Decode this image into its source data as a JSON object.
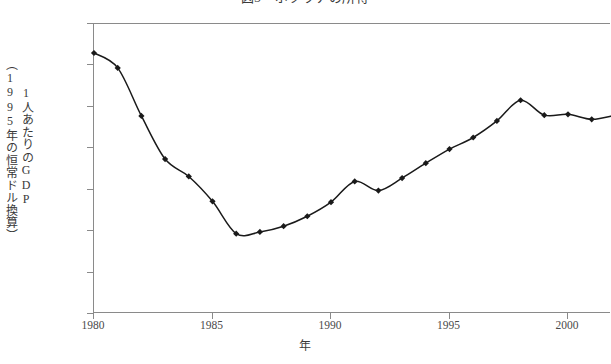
{
  "chart_data": {
    "type": "line",
    "title": "図3　ボツワナの所得",
    "xlabel": "年",
    "ylabel": "1人あたりのGDP（1995年の恒常ドル換算）",
    "ylabel_columns": [
      "（1995年の恒常ドル換算）",
      "1人あたりのGDP"
    ],
    "xlim": [
      1980,
      2002
    ],
    "ylim": [
      700,
      1050
    ],
    "yticks": [
      700,
      750,
      800,
      850,
      900,
      950,
      1000,
      1050
    ],
    "ytick_labels": [
      "700",
      "750",
      "800",
      "850",
      "900",
      "950",
      "1000",
      "1050"
    ],
    "xticks": [
      1980,
      1985,
      1990,
      1995,
      2000
    ],
    "xtick_labels": [
      "1980",
      "1985",
      "1990",
      "1995",
      "2000"
    ],
    "grid": false,
    "legend": false,
    "marker": "diamond",
    "line_color": "#1a1a1a",
    "x": [
      1980,
      1981,
      1982,
      1983,
      1984,
      1985,
      1986,
      1987,
      1988,
      1989,
      1990,
      1991,
      1992,
      1993,
      1994,
      1995,
      1996,
      1997,
      1998,
      1999,
      2000,
      2001,
      2002
    ],
    "values": [
      1015,
      997,
      939,
      887,
      866,
      836,
      797,
      799,
      806,
      818,
      835,
      860,
      849,
      864,
      882,
      899,
      913,
      933,
      958,
      940,
      941,
      935,
      940
    ]
  }
}
